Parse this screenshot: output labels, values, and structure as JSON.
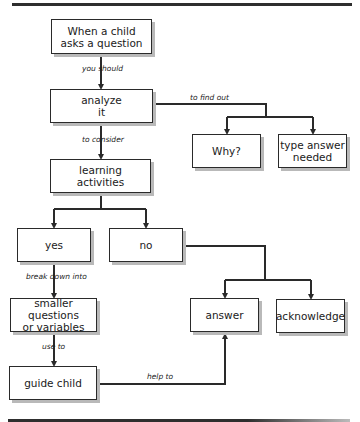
{
  "diagram": {
    "nodes": {
      "start": "When a child asks a question",
      "analyze": "analyze it",
      "why": "Why?",
      "type_answer": "type answer needed",
      "learning": "learning activities",
      "yes": "yes",
      "no": "no",
      "smaller": "smaller questions or variables",
      "guide": "guide child",
      "answer": "answer",
      "acknowledge": "acknowledge"
    },
    "node_lines": {
      "start": [
        "When a child",
        "asks a question"
      ],
      "analyze": [
        "analyze",
        "it"
      ],
      "type_answer": [
        "type answer",
        "needed"
      ],
      "learning": [
        "learning",
        "activities"
      ],
      "smaller": [
        "smaller questions",
        "or variables"
      ]
    },
    "edges": {
      "you_should": "you should",
      "to_find_out": "to find out",
      "to_consider": "to consider",
      "break_down_into": "break down into",
      "use_to": "use to",
      "help_to": "help to"
    },
    "colors": {
      "line": "#2a2a2a",
      "shadow": "#b9b9b9",
      "background": "#ffffff"
    }
  }
}
